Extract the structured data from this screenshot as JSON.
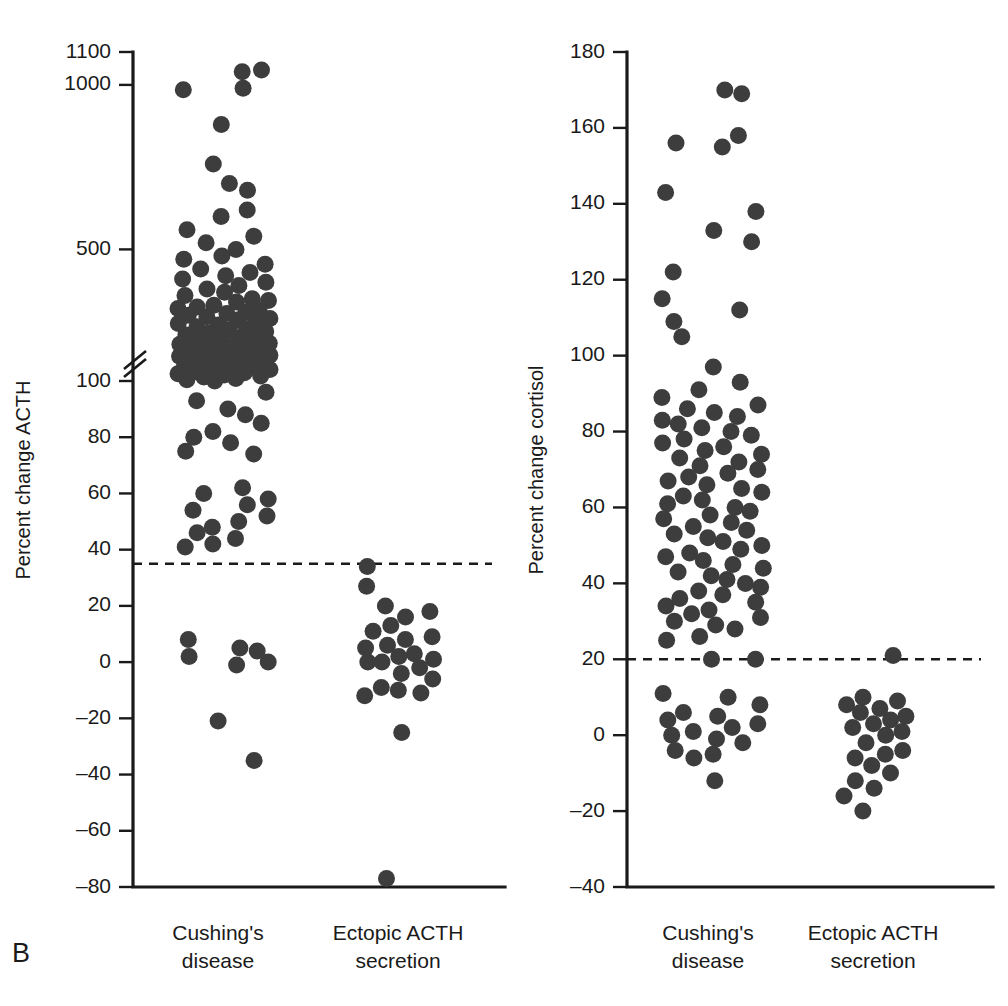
{
  "figure": {
    "panel_letter": "B",
    "background": "#ffffff",
    "dot_color": "#3d3d3d",
    "axis_color": "#1a1a1a"
  },
  "chart_data": [
    {
      "type": "scatter",
      "id": "acth",
      "title": "",
      "ylabel": "Percent change ACTH",
      "xlabel": "",
      "grid": false,
      "legend": "none",
      "ylim": [
        -80,
        1100
      ],
      "yticks": [
        -80,
        -60,
        -40,
        -20,
        0,
        20,
        40,
        60,
        80,
        100,
        500,
        1000,
        1100
      ],
      "ytick_labels": [
        "–80",
        "–60",
        "–40",
        "–20",
        "0",
        "20",
        "40",
        "60",
        "80",
        "100",
        "500",
        "1000",
        "1100"
      ],
      "axis_break": {
        "between": [
          100,
          500
        ],
        "style": "double-slash"
      },
      "annotations": [
        {
          "type": "hline",
          "value": 35,
          "style": "dashed",
          "label": "diagnostic cutoff"
        }
      ],
      "categories": [
        "Cushing's disease",
        "Ectopic ACTH secretion"
      ],
      "series": [
        {
          "name": "Cushing's disease",
          "values": [
            1040,
            1045,
            985,
            990,
            880,
            760,
            700,
            680,
            620,
            600,
            560,
            540,
            520,
            500,
            480,
            470,
            455,
            440,
            430,
            420,
            410,
            400,
            390,
            380,
            370,
            360,
            350,
            345,
            340,
            330,
            325,
            320,
            315,
            310,
            305,
            300,
            295,
            290,
            285,
            280,
            275,
            270,
            265,
            260,
            255,
            250,
            245,
            240,
            235,
            230,
            225,
            220,
            215,
            212,
            208,
            205,
            200,
            196,
            192,
            188,
            185,
            182,
            178,
            175,
            172,
            168,
            165,
            162,
            158,
            155,
            152,
            148,
            145,
            142,
            138,
            135,
            132,
            128,
            125,
            122,
            118,
            115,
            112,
            108,
            104,
            100,
            96,
            93,
            90,
            88,
            85,
            82,
            80,
            78,
            75,
            74,
            62,
            60,
            58,
            56,
            54,
            52,
            50,
            48,
            46,
            44,
            42,
            41,
            8,
            5,
            4,
            2,
            0,
            -1,
            -21,
            -35
          ]
        },
        {
          "name": "Ectopic ACTH secretion",
          "values": [
            34,
            27,
            20,
            18,
            16,
            13,
            11,
            9,
            8,
            6,
            5,
            3,
            2,
            1,
            0,
            0,
            -2,
            -4,
            -6,
            -9,
            -10,
            -11,
            -12,
            -25,
            -77
          ]
        }
      ]
    },
    {
      "type": "scatter",
      "id": "cortisol",
      "title": "",
      "ylabel": "Percent change cortisol",
      "xlabel": "",
      "grid": false,
      "legend": "none",
      "ylim": [
        -40,
        180
      ],
      "yticks": [
        -40,
        -20,
        0,
        20,
        40,
        60,
        80,
        100,
        120,
        140,
        160,
        180
      ],
      "ytick_labels": [
        "–40",
        "–20",
        "0",
        "20",
        "40",
        "60",
        "80",
        "100",
        "120",
        "140",
        "160",
        "180"
      ],
      "annotations": [
        {
          "type": "hline",
          "value": 20,
          "style": "dashed",
          "label": "diagnostic cutoff"
        }
      ],
      "categories": [
        "Cushing's disease",
        "Ectopic ACTH secretion"
      ],
      "series": [
        {
          "name": "Cushing's disease",
          "values": [
            170,
            169,
            158,
            156,
            155,
            143,
            138,
            133,
            130,
            122,
            115,
            112,
            109,
            105,
            97,
            93,
            91,
            89,
            87,
            86,
            85,
            84,
            83,
            82,
            81,
            80,
            79,
            78,
            77,
            76,
            75,
            74,
            73,
            72,
            71,
            70,
            69,
            68,
            67,
            66,
            65,
            64,
            63,
            62,
            61,
            60,
            59,
            58,
            57,
            56,
            55,
            54,
            53,
            52,
            51,
            50,
            49,
            48,
            47,
            46,
            45,
            44,
            43,
            42,
            41,
            40,
            39,
            38,
            37,
            36,
            35,
            34,
            33,
            32,
            31,
            30,
            29,
            28,
            26,
            25,
            20,
            20,
            11,
            10,
            8,
            6,
            5,
            4,
            3,
            2,
            1,
            0,
            -1,
            -2,
            -4,
            -5,
            -6,
            -12
          ]
        },
        {
          "name": "Ectopic ACTH secretion",
          "values": [
            21,
            10,
            9,
            8,
            7,
            6,
            5,
            4,
            3,
            2,
            1,
            0,
            -2,
            -4,
            -5,
            -6,
            -8,
            -10,
            -12,
            -14,
            -16,
            -20
          ]
        }
      ]
    }
  ]
}
